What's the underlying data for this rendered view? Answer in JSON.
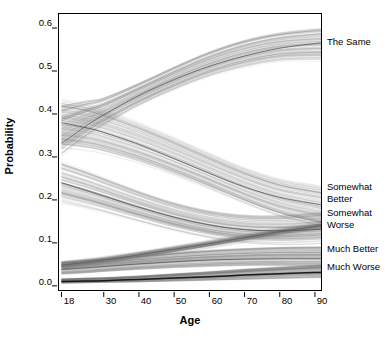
{
  "figure": {
    "background": "#ffffff",
    "frame_color": "#000000",
    "plot_area": {
      "left": 58,
      "top": 13,
      "right": 322,
      "bottom": 291
    }
  },
  "axes": {
    "xlabel": "Age",
    "ylabel": "Probability",
    "xticks": [
      18,
      30,
      40,
      50,
      60,
      70,
      80,
      90
    ],
    "xtick_labels": [
      "18",
      "30",
      "40",
      "50",
      "60",
      "70",
      "80",
      "90"
    ],
    "yticks": [
      0.0,
      0.1,
      0.2,
      0.3,
      0.4,
      0.5,
      0.6
    ],
    "ytick_labels": [
      "0.0",
      "0.1",
      "0.2",
      "0.3",
      "0.4",
      "0.5",
      "0.6"
    ],
    "xlim": [
      17,
      92
    ],
    "ylim": [
      -0.012,
      0.635
    ]
  },
  "series_labels": [
    {
      "text": "The Same",
      "y_px": 41
    },
    {
      "text": "Somewhat\nBetter",
      "y_px": 186
    },
    {
      "text": "Somewhat\nWorse",
      "y_px": 212
    },
    {
      "text": "Much Better",
      "y_px": 248
    },
    {
      "text": "Much Worse",
      "y_px": 266
    }
  ],
  "chart_data": {
    "type": "line",
    "title": "",
    "subtitle": "",
    "xlabel": "Age",
    "ylabel": "Probability",
    "xlim": [
      17,
      92
    ],
    "ylim": [
      0.0,
      0.635
    ],
    "grid": false,
    "legend_position": "right-outside (direct labels at line ends)",
    "annotations": [
      "Spaghetti plot of bootstrap / posterior replicate curves; one faint gray curve per replicate with a darker median curve per outcome category."
    ],
    "x": [
      18,
      25,
      30,
      40,
      50,
      60,
      70,
      80,
      90,
      92
    ],
    "series": [
      {
        "name": "The Same",
        "color": "#555555",
        "style": "median",
        "values": [
          0.332,
          0.372,
          0.398,
          0.443,
          0.48,
          0.511,
          0.535,
          0.553,
          0.564,
          0.565
        ],
        "band_low": [
          0.3,
          0.345,
          0.372,
          0.418,
          0.455,
          0.486,
          0.508,
          0.522,
          0.524,
          0.523
        ],
        "band_high": [
          0.418,
          0.43,
          0.438,
          0.472,
          0.51,
          0.545,
          0.572,
          0.589,
          0.598,
          0.598
        ]
      },
      {
        "name": "Somewhat Better",
        "color": "#555555",
        "style": "median",
        "values": [
          0.38,
          0.368,
          0.357,
          0.329,
          0.296,
          0.262,
          0.23,
          0.206,
          0.191,
          0.189
        ],
        "band_low": [
          0.325,
          0.318,
          0.31,
          0.287,
          0.258,
          0.226,
          0.192,
          0.162,
          0.142,
          0.138
        ],
        "band_high": [
          0.43,
          0.42,
          0.408,
          0.378,
          0.344,
          0.308,
          0.274,
          0.248,
          0.234,
          0.232
        ]
      },
      {
        "name": "Somewhat Worse",
        "color": "#555555",
        "style": "median",
        "values": [
          0.24,
          0.222,
          0.209,
          0.183,
          0.16,
          0.142,
          0.131,
          0.128,
          0.131,
          0.132
        ],
        "band_low": [
          0.195,
          0.182,
          0.172,
          0.15,
          0.129,
          0.112,
          0.101,
          0.097,
          0.099,
          0.1
        ],
        "band_high": [
          0.288,
          0.268,
          0.252,
          0.221,
          0.194,
          0.175,
          0.165,
          0.164,
          0.17,
          0.172
        ]
      },
      {
        "name": "Much Better",
        "color": "#555555",
        "style": "median",
        "values": [
          0.038,
          0.042,
          0.045,
          0.051,
          0.056,
          0.06,
          0.062,
          0.063,
          0.063,
          0.063
        ],
        "band_low": [
          0.028,
          0.031,
          0.034,
          0.039,
          0.043,
          0.046,
          0.048,
          0.048,
          0.047,
          0.047
        ],
        "band_high": [
          0.056,
          0.06,
          0.063,
          0.07,
          0.077,
          0.083,
          0.087,
          0.09,
          0.091,
          0.091
        ]
      },
      {
        "name": "Much Worse",
        "color": "#111111",
        "style": "median",
        "values": [
          0.01,
          0.011,
          0.012,
          0.015,
          0.018,
          0.021,
          0.025,
          0.028,
          0.031,
          0.032
        ],
        "band_low": [
          0.006,
          0.007,
          0.008,
          0.009,
          0.011,
          0.013,
          0.015,
          0.017,
          0.019,
          0.019
        ],
        "band_high": [
          0.016,
          0.018,
          0.019,
          0.023,
          0.028,
          0.033,
          0.039,
          0.044,
          0.048,
          0.049
        ]
      },
      {
        "name": "Rising bundle (Somewhat Worse upper replicates)",
        "color": "#666666",
        "style": "replicate-bundle",
        "values": [
          0.048,
          0.055,
          0.06,
          0.072,
          0.085,
          0.098,
          0.112,
          0.126,
          0.138,
          0.14
        ]
      }
    ]
  }
}
